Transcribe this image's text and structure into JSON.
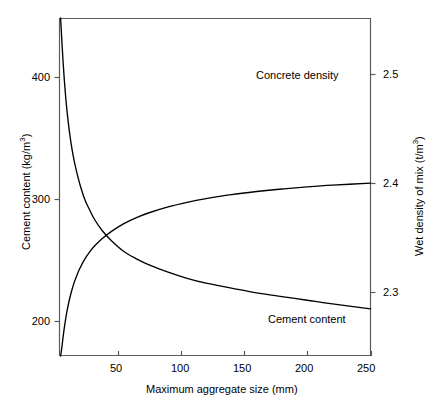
{
  "chart_data": {
    "type": "line",
    "title": "",
    "xlabel": "Maximum aggregate size (mm)",
    "ylabel": "Cement content (kg/m3)",
    "y2label": "Wet density of mix (t/m3)",
    "xlim": [
      0,
      250
    ],
    "ylim": [
      170,
      455
    ],
    "y2lim": [
      2.2389,
      2.5
    ],
    "grid": false,
    "legend_position": "inline-annotations",
    "xticks": [
      50,
      100,
      150,
      200,
      250
    ],
    "xtick_labels": [
      "50",
      "100",
      "150",
      "200",
      "250"
    ],
    "yticks": [
      200,
      300,
      400
    ],
    "ytick_labels": [
      "200",
      "300",
      "400"
    ],
    "y2ticks": [
      2.3,
      2.4,
      2.5
    ],
    "y2tick_labels": [
      "2.3",
      "2.4",
      "2.5"
    ],
    "series": [
      {
        "name": "Cement content",
        "axis": "left",
        "annotation": "Cement content",
        "x": [
          5,
          6,
          7,
          8,
          9,
          10,
          12,
          14,
          16,
          18,
          20,
          24,
          28,
          32,
          38,
          45,
          55,
          65,
          75,
          90,
          105,
          120,
          140,
          160,
          180,
          200,
          220,
          250
        ],
        "values": [
          452,
          430,
          412,
          397,
          384,
          373,
          355,
          341,
          330,
          321,
          313,
          300,
          291,
          283,
          274,
          266,
          257,
          251,
          246,
          240,
          235,
          231,
          227,
          223,
          220,
          217,
          214,
          210
        ]
      },
      {
        "name": "Concrete density",
        "axis": "right",
        "annotation": "Concrete density",
        "x": [
          5,
          6,
          7,
          8,
          9,
          10,
          12,
          14,
          16,
          18,
          20,
          24,
          28,
          32,
          38,
          45,
          55,
          65,
          75,
          90,
          105,
          120,
          140,
          160,
          180,
          200,
          220,
          250
        ],
        "values": [
          2.2389,
          2.2489,
          2.2589,
          2.2676,
          2.2752,
          2.2819,
          2.2931,
          2.3021,
          2.3095,
          2.3157,
          2.3211,
          2.3299,
          2.3368,
          2.3424,
          2.3491,
          2.3554,
          2.3627,
          2.3683,
          2.3727,
          2.3781,
          2.3823,
          2.3857,
          2.3894,
          2.3922,
          2.3945,
          2.3964,
          2.398,
          2.3999
        ]
      }
    ]
  },
  "axes": {
    "left": {
      "title_text": "Cement content (kg/m",
      "title_sup": "3",
      "title_close": ")",
      "labels": [
        "400",
        "300",
        "200"
      ]
    },
    "right": {
      "title_text": "Wet density of mix (t/m",
      "title_sup": "3",
      "title_close": ")",
      "labels": [
        "2.5",
        "2.4",
        "2.3"
      ]
    },
    "bottom": {
      "title": "Maximum aggregate size (mm)",
      "labels": [
        "50",
        "100",
        "150",
        "200",
        "250"
      ]
    }
  },
  "annotations": {
    "concrete_density": "Concrete density",
    "cement_content": "Cement content"
  },
  "colors": {
    "line": "#000000",
    "axis": "#5a5a5a",
    "text": "#000000",
    "background": "#ffffff"
  }
}
